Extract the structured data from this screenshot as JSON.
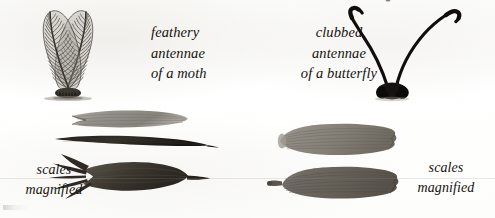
{
  "plate": {
    "title": "Feathery antennae of a moth and clubbed antennae of a butterfly, with scales magnified",
    "background_color": "#fdfdfc",
    "ink_color": "#16120e"
  },
  "captions": {
    "moth_antennae": {
      "line1": "feathery",
      "line2": "antennae",
      "line3": "of a moth"
    },
    "butterfly_antennae": {
      "line1": "clubbed",
      "line2": "antennae",
      "line3": "of a butterfly"
    },
    "moth_scales": {
      "line1": "scales",
      "line2": "magnified"
    },
    "butterfly_scales": {
      "line1": "scales",
      "line2": "magnified"
    }
  },
  "figures": {
    "moth_antennae": {
      "name": "feathery-moth-antennae",
      "description": "A pair of bipectinate plumed antennae rising in a V from a dark basal segment, each with a central shaft and many fine angled barbs",
      "plume_count": 2,
      "barbs_per_plume": 26,
      "ink": "#4a463f",
      "shaft_ink": "#2e2a24",
      "base_ink": "#2b2720"
    },
    "butterfly_antennae": {
      "name": "clubbed-butterfly-antennae",
      "description": "A pair of slender dark antennae curving outward from a solid bulbous base, each thickening into a hooked club at the tip",
      "antenna_count": 2,
      "ink": "#100d0a"
    },
    "moth_scales": {
      "name": "magnified-moth-scales",
      "description": "Three elongated lance-shaped moth scales shown magnified",
      "items": [
        {
          "label": "scale-1",
          "shape": "elongate forked blade",
          "tone": "#8e8a82"
        },
        {
          "label": "scale-2",
          "shape": "slender dark tapering blade",
          "tone": "#322e28"
        },
        {
          "label": "scale-3",
          "shape": "multi-pronged fringed blade",
          "tone": "#413d36"
        }
      ]
    },
    "butterfly_scales": {
      "name": "magnified-butterfly-scales",
      "description": "Two broad paddle-shaped butterfly scales with longitudinal striations and scalloped outer margins",
      "items": [
        {
          "label": "scale-1",
          "shape": "broad striated paddle",
          "tone": "#8a867e"
        },
        {
          "label": "scale-2",
          "shape": "broad striated paddle with basal stalk",
          "tone": "#6f6b63"
        }
      ]
    }
  }
}
